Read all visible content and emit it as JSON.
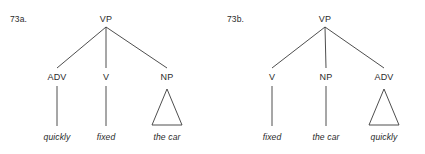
{
  "figure": {
    "background_color": "#ffffff",
    "line_color": "#3a3a3a",
    "text_color": "#2b2b2b",
    "width": 425,
    "height": 154
  },
  "trees": [
    {
      "id": "73a",
      "label": "73a.",
      "root": "VP",
      "nodes": [
        {
          "label": "ADV",
          "terminal": "quickly",
          "child_type": "stem"
        },
        {
          "label": "V",
          "terminal": "fixed",
          "child_type": "stem"
        },
        {
          "label": "NP",
          "terminal": "the car",
          "child_type": "triangle"
        }
      ]
    },
    {
      "id": "73b",
      "label": "73b.",
      "root": "VP",
      "nodes": [
        {
          "label": "V",
          "terminal": "fixed",
          "child_type": "stem"
        },
        {
          "label": "NP",
          "terminal": "the car",
          "child_type": "stem"
        },
        {
          "label": "ADV",
          "terminal": "quickly",
          "child_type": "triangle"
        }
      ]
    }
  ]
}
